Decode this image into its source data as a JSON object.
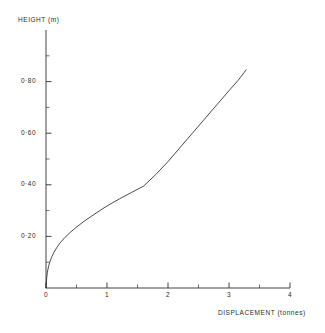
{
  "chart_data": {
    "type": "line",
    "title": "",
    "xlabel": "DISPLACEMENT (tonnes)",
    "ylabel": "HEIGHT (m)",
    "xlim": [
      0,
      4
    ],
    "ylim": [
      0,
      1.0
    ],
    "grid": false,
    "legend": null,
    "x_ticks": [
      0,
      1,
      2,
      3,
      4
    ],
    "x_tick_labels": [
      "0",
      "1",
      "2",
      "3",
      "4"
    ],
    "x_minor_ticks": [
      0.5,
      1.5,
      2.5,
      3.5
    ],
    "y_ticks": [
      0.2,
      0.4,
      0.6,
      0.8
    ],
    "y_tick_labels": [
      "0·20",
      "0·40",
      "0·60",
      "0·80"
    ],
    "y_minor_ticks": [
      0.1,
      0.3,
      0.5,
      0.7,
      0.9
    ],
    "series": [
      {
        "name": "height vs displacement",
        "x": [
          0.0,
          0.01,
          0.02,
          0.04,
          0.06,
          0.09,
          0.13,
          0.18,
          0.24,
          0.31,
          0.4,
          0.5,
          0.62,
          0.75,
          0.9,
          1.05,
          1.2,
          1.4,
          1.6,
          1.8,
          2.0,
          2.2,
          2.4,
          2.6,
          2.8,
          3.0,
          3.15,
          3.28
        ],
        "y": [
          0.0,
          0.035,
          0.058,
          0.082,
          0.099,
          0.118,
          0.138,
          0.158,
          0.177,
          0.196,
          0.216,
          0.236,
          0.258,
          0.279,
          0.303,
          0.325,
          0.345,
          0.37,
          0.395,
          0.44,
          0.49,
          0.545,
          0.6,
          0.655,
          0.71,
          0.765,
          0.805,
          0.845
        ]
      }
    ],
    "line_color": "#2b2b2b",
    "axis_color": "#303030"
  },
  "axes": {
    "y_title": "HEIGHT (m)",
    "x_title": "DISPLACEMENT (tonnes)"
  }
}
